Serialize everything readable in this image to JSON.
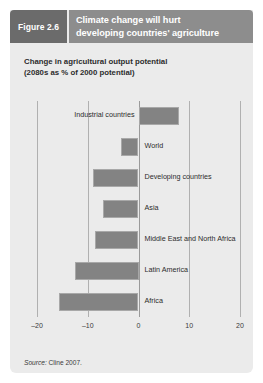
{
  "figure": {
    "number_label": "Figure 2.6",
    "title_line1": "Climate change will hurt",
    "title_line2": "developing countries' agriculture",
    "subtitle_line1": "Change in agricultural output potential",
    "subtitle_line2": "(2080s as % of 2000 potential)",
    "source_word": "Source:",
    "source_text": "Cline 2007."
  },
  "colors": {
    "card_background": "#ebebeb",
    "figure_number_background": "#6b6b6b",
    "title_background": "#8d8d8d",
    "bar_fill": "#838383",
    "bar_border": "#a8a8a8",
    "gridline": "#b0b0b0",
    "text": "#2c2c2c"
  },
  "chart_data": {
    "type": "bar",
    "orientation": "horizontal",
    "title": "Climate change will hurt developing countries' agriculture",
    "subtitle": "Change in agricultural output potential (2080s as % of 2000 potential)",
    "xlabel": "",
    "ylabel": "",
    "xlim": [
      -20,
      20
    ],
    "xticks": [
      -20,
      -10,
      0,
      10,
      20
    ],
    "xtick_labels": [
      "–20",
      "–10",
      "0",
      "10",
      "20"
    ],
    "grid": true,
    "legend": false,
    "categories": [
      "Industrial countries",
      "World",
      "Developing countries",
      "Asia",
      "Middle East and North Africa",
      "Latin America",
      "Africa"
    ],
    "values": [
      8.0,
      -3.5,
      -9.0,
      -7.0,
      -8.5,
      -12.5,
      -15.7
    ],
    "source": "Source: Cline 2007."
  }
}
